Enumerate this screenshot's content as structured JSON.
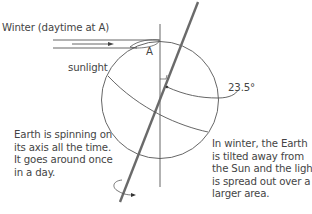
{
  "diagram": {
    "title_label": "Winter (daytime at A)",
    "sunlight_label": "sunlight",
    "point_label": "A",
    "angle_label": "23.5°",
    "spin_note": "Earth is spinning on\nits axis all the time.\nIt goes around once\nin a day.",
    "winter_note": "In winter, the Earth\nis tilted away from\nthe Sun and the light\nis spread out over a\nlarger area.",
    "colors": {
      "line": "#555555",
      "axis": "#6a6a6a",
      "text": "#444444"
    }
  }
}
